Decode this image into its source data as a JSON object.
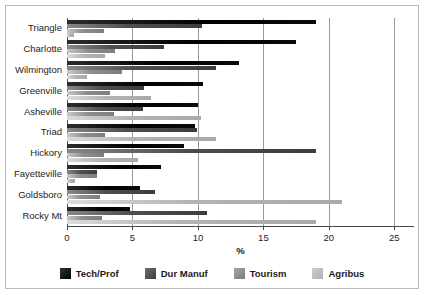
{
  "chart_data": {
    "type": "bar",
    "orientation": "horizontal",
    "title": "",
    "xlabel": "%",
    "ylabel": "",
    "xlim": [
      0,
      26.5
    ],
    "xticks": [
      0,
      5,
      10,
      15,
      20,
      25
    ],
    "grid": true,
    "legend_position": "bottom",
    "categories": [
      "Triangle",
      "Charlotte",
      "Wilmington",
      "Greenville",
      "Asheville",
      "Triad",
      "Hickory",
      "Fayetteville",
      "Goldsboro",
      "Rocky Mt"
    ],
    "series": [
      {
        "name": "Tech/Prof",
        "color": "#000000",
        "values": [
          19.0,
          17.5,
          13.1,
          10.4,
          10.0,
          9.8,
          8.9,
          7.2,
          5.6,
          4.8
        ]
      },
      {
        "name": "Dur Manuf",
        "color": "#434343",
        "values": [
          10.3,
          7.4,
          11.4,
          5.9,
          5.8,
          9.9,
          19.0,
          2.3,
          6.7,
          10.7
        ]
      },
      {
        "name": "Tourism",
        "color": "#838383",
        "values": [
          2.8,
          3.7,
          4.2,
          3.3,
          3.6,
          2.9,
          2.8,
          2.3,
          2.5,
          2.7
        ]
      },
      {
        "name": "Agribus",
        "color": "#b3b3b3",
        "values": [
          0.5,
          2.9,
          1.5,
          6.4,
          10.2,
          11.4,
          5.4,
          0.6,
          21.0,
          19.0
        ]
      }
    ]
  }
}
